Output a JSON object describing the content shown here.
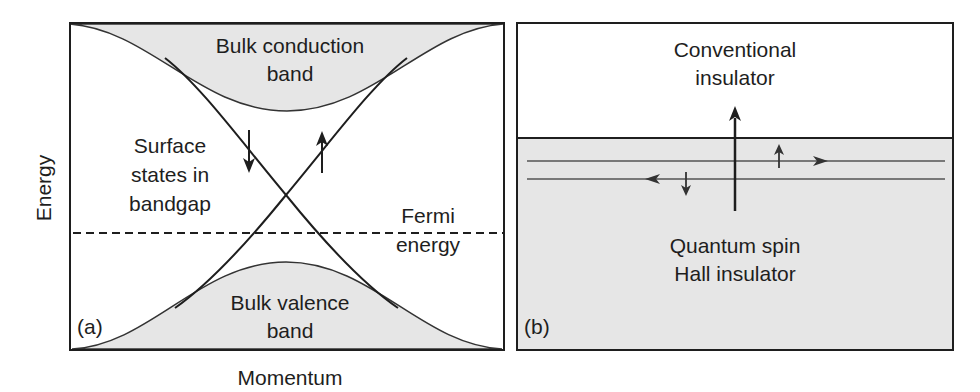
{
  "panel_a": {
    "tag": "(a)",
    "x_axis_label": "Momentum",
    "y_axis_label": "Energy",
    "conduction_band": {
      "line1": "Bulk conduction",
      "line2": "band"
    },
    "valence_band": {
      "line1": "Bulk valence",
      "line2": "band"
    },
    "surface_states": {
      "line1": "Surface",
      "line2": "states in",
      "line3": "bandgap"
    },
    "fermi": {
      "line1": "Fermi",
      "line2": "energy"
    },
    "spin_arrows": [
      "spin-down",
      "spin-up"
    ]
  },
  "panel_b": {
    "tag": "(b)",
    "top_region": {
      "line1": "Conventional",
      "line2": "insulator"
    },
    "bottom_region": {
      "line1": "Quantum spin",
      "line2": "Hall insulator"
    },
    "edge_channels": [
      {
        "direction": "right",
        "spin": "up"
      },
      {
        "direction": "left",
        "spin": "down"
      }
    ]
  },
  "colors": {
    "band_fill": "#e6e6e6",
    "line": "#1e1e1e",
    "edge_line": "#555555",
    "background": "#ffffff"
  }
}
